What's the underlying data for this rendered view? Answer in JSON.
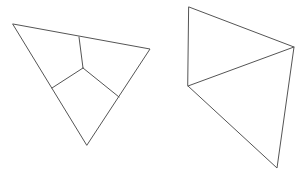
{
  "canvas": {
    "width": 305,
    "height": 175,
    "background": "#ffffff",
    "stroke_color": "#555555"
  },
  "figures": [
    {
      "name": "subdivided-triangle",
      "vertices": {
        "top_left": [
          13,
          24
        ],
        "right": [
          150,
          49
        ],
        "bottom": [
          87,
          145
        ],
        "center": [
          83,
          68
        ],
        "top_mid": [
          79,
          37
        ],
        "left_mid": [
          52,
          88
        ],
        "right_mid": [
          119,
          97
        ]
      }
    },
    {
      "name": "split-quadrilateral",
      "vertices": {
        "top": [
          189,
          7
        ],
        "right": [
          294,
          47
        ],
        "left": [
          188,
          86
        ],
        "bottom": [
          277,
          168
        ]
      }
    }
  ]
}
